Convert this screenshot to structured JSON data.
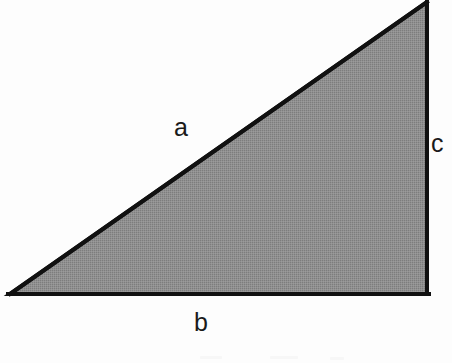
{
  "figure": {
    "background_color": "#fdfdfd",
    "fill_color": "#8c8c8c",
    "fill_pattern": "halftone-dither-gray",
    "stroke_color": "#111111",
    "stroke_width": 4,
    "label_color": "#1a1a1a"
  },
  "geometry": {
    "type": "right-triangle",
    "vertices": [
      {
        "name": "bottom-left",
        "x": 10,
        "y": 294
      },
      {
        "name": "bottom-right",
        "x": 427,
        "y": 294
      },
      {
        "name": "top-right",
        "x": 427,
        "y": 2
      }
    ],
    "right_angle_at": "bottom-right"
  },
  "labels": {
    "hypotenuse": "a",
    "base": "b",
    "vertical": "c"
  },
  "label_positions": {
    "hypotenuse": {
      "x": 185,
      "y": 128
    },
    "base": {
      "x": 203,
      "y": 323
    },
    "vertical": {
      "x": 439,
      "y": 144
    }
  }
}
